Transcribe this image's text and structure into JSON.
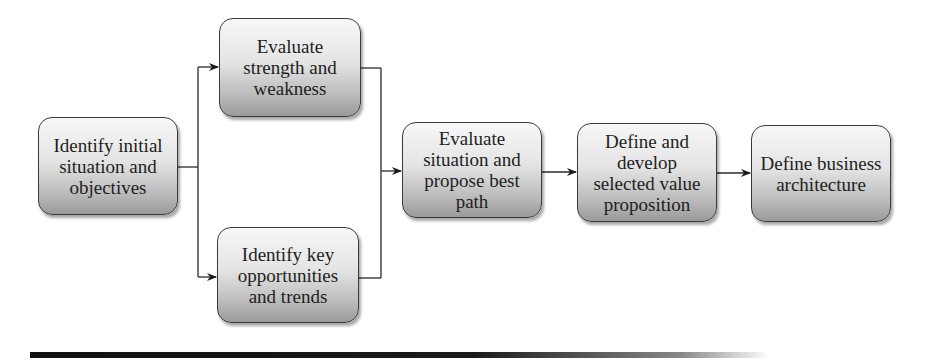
{
  "diagram": {
    "type": "flowchart",
    "nodes": [
      {
        "id": "n1",
        "label": "Identify initial situation and objectives",
        "lines": [
          "Identify initial",
          "situation and",
          "objectives"
        ]
      },
      {
        "id": "n2",
        "label": "Evaluate strength and weakness",
        "lines": [
          "Evaluate",
          "strength and",
          "weakness"
        ]
      },
      {
        "id": "n3",
        "label": "Identify key opportunities and trends",
        "lines": [
          "Identify key",
          "opportunities",
          "and trends"
        ]
      },
      {
        "id": "n4",
        "label": "Evaluate situation and propose best path",
        "lines": [
          "Evaluate",
          "situation and",
          "propose best",
          "path"
        ]
      },
      {
        "id": "n5",
        "label": "Define and develop selected value proposition",
        "lines": [
          "Define and",
          "develop",
          "selected value",
          "proposition"
        ]
      },
      {
        "id": "n6",
        "label": "Define business architecture",
        "lines": [
          "Define business",
          "architecture"
        ]
      }
    ],
    "edges": [
      {
        "from": "n1",
        "to": "n2"
      },
      {
        "from": "n1",
        "to": "n3"
      },
      {
        "from": "n2",
        "to": "n4"
      },
      {
        "from": "n3",
        "to": "n4"
      },
      {
        "from": "n4",
        "to": "n5"
      },
      {
        "from": "n5",
        "to": "n6"
      }
    ],
    "colors": {
      "box_border": "#3a3a3a",
      "box_gradient_top": "#f7f7f7",
      "box_gradient_bottom": "#9a9a9a",
      "connector": "#2a2a2a",
      "text": "#1e1e1e",
      "rule": "#111111"
    }
  }
}
